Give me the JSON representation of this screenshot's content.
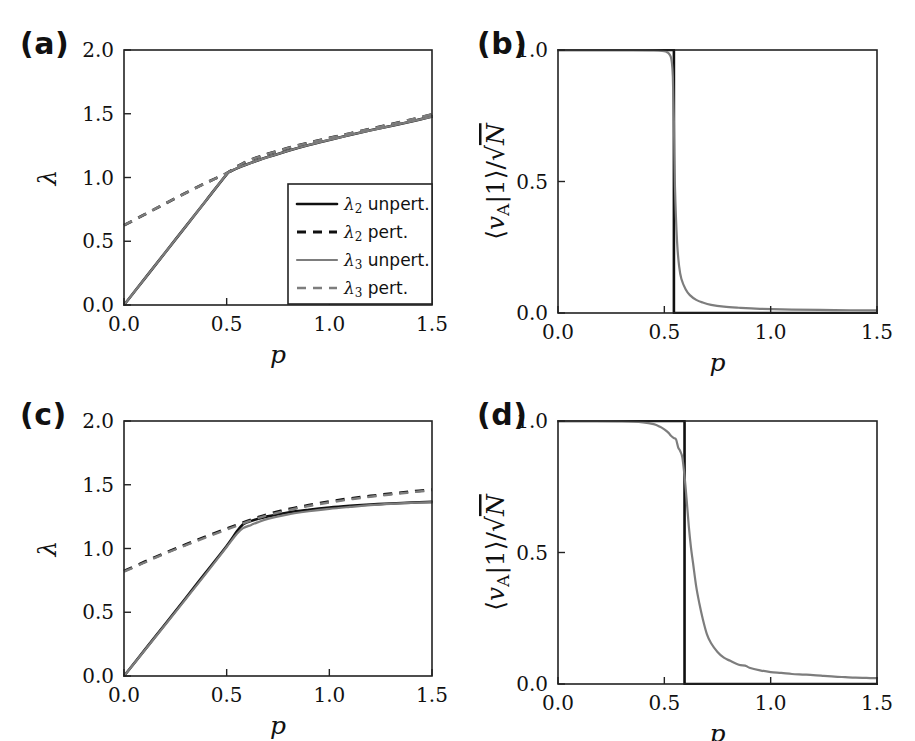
{
  "figure": {
    "width": 915,
    "height": 741,
    "background": "#ffffff",
    "panel_labels": [
      "(a)",
      "(b)",
      "(c)",
      "(d)"
    ]
  },
  "colors": {
    "black": "#101010",
    "gray": "#7d7d7d",
    "axis": "#222222",
    "background": "#ffffff"
  },
  "panels": {
    "a": {
      "label": "(a)",
      "xlabel": "p",
      "ylabel": "λ",
      "xticks": [
        "0.0",
        "0.5",
        "1.0",
        "1.5"
      ],
      "yticks": [
        "0.0",
        "0.5",
        "1.0",
        "1.5",
        "2.0"
      ],
      "legend": [
        {
          "label_lambda": "λ",
          "label_sub": "2",
          "label_rest": " unpert.",
          "style": "black-solid"
        },
        {
          "label_lambda": "λ",
          "label_sub": "2",
          "label_rest": " pert.",
          "style": "black-dashed"
        },
        {
          "label_lambda": "λ",
          "label_sub": "3",
          "label_rest": " unpert.",
          "style": "gray-solid"
        },
        {
          "label_lambda": "λ",
          "label_sub": "3",
          "label_rest": " pert.",
          "style": "gray-dashed"
        }
      ]
    },
    "b": {
      "label": "(b)",
      "xlabel": "p",
      "ylabel_parts": [
        "⟨",
        "v",
        "A",
        "|1",
        "⟩",
        "/",
        "√",
        "N"
      ],
      "xticks": [
        "0.0",
        "0.5",
        "1.0",
        "1.5"
      ],
      "yticks": [
        "0.0",
        "0.5",
        "1.0"
      ]
    },
    "c": {
      "label": "(c)",
      "xlabel": "p",
      "ylabel": "λ",
      "xticks": [
        "0.0",
        "0.5",
        "1.0",
        "1.5"
      ],
      "yticks": [
        "0.0",
        "0.5",
        "1.0",
        "1.5",
        "2.0"
      ]
    },
    "d": {
      "label": "(d)",
      "xlabel": "p",
      "ylabel_parts": [
        "⟨",
        "v",
        "A",
        "|1",
        "⟩",
        "/",
        "√",
        "N"
      ],
      "xticks": [
        "0.0",
        "0.5",
        "1.0",
        "1.5"
      ],
      "yticks": [
        "0.0",
        "0.5",
        "1.0"
      ]
    }
  },
  "chart_data": [
    {
      "id": "panel-a",
      "type": "line",
      "title": "(a)",
      "xlabel": "p",
      "ylabel": "λ",
      "xlim": [
        0.0,
        1.5
      ],
      "ylim": [
        0.0,
        2.0
      ],
      "xticks": [
        0.0,
        0.5,
        1.0,
        1.5
      ],
      "yticks": [
        0.0,
        0.5,
        1.0,
        1.5,
        2.0
      ],
      "grid": false,
      "legend_position": "lower right",
      "series": [
        {
          "name": "λ2 unpert.",
          "style": "solid",
          "color": "#101010",
          "x": [
            0.0,
            0.1,
            0.2,
            0.3,
            0.4,
            0.5,
            0.52,
            0.55,
            0.6,
            0.65,
            0.7,
            0.8,
            0.9,
            1.0,
            1.1,
            1.2,
            1.3,
            1.4,
            1.5
          ],
          "y": [
            0.0,
            0.205,
            0.41,
            0.615,
            0.82,
            1.025,
            1.048,
            1.072,
            1.104,
            1.133,
            1.16,
            1.21,
            1.255,
            1.295,
            1.333,
            1.37,
            1.404,
            1.44,
            1.478
          ]
        },
        {
          "name": "λ2 pert.",
          "style": "dashed",
          "color": "#101010",
          "x": [
            0.0,
            0.1,
            0.2,
            0.3,
            0.4,
            0.5,
            0.55,
            0.6,
            0.65,
            0.7,
            0.8,
            0.9,
            1.0,
            1.1,
            1.2,
            1.3,
            1.4,
            1.5
          ],
          "y": [
            0.625,
            0.71,
            0.795,
            0.878,
            0.958,
            1.034,
            1.085,
            1.128,
            1.158,
            1.185,
            1.232,
            1.272,
            1.31,
            1.345,
            1.382,
            1.418,
            1.455,
            1.495
          ]
        },
        {
          "name": "λ3 unpert.",
          "style": "solid",
          "color": "#7d7d7d",
          "x": [
            0.0,
            0.1,
            0.2,
            0.3,
            0.4,
            0.5,
            0.52,
            0.55,
            0.6,
            0.65,
            0.7,
            0.8,
            0.9,
            1.0,
            1.1,
            1.2,
            1.3,
            1.4,
            1.5
          ],
          "y": [
            0.0,
            0.205,
            0.41,
            0.615,
            0.82,
            1.025,
            1.048,
            1.072,
            1.104,
            1.133,
            1.16,
            1.21,
            1.255,
            1.295,
            1.333,
            1.37,
            1.404,
            1.44,
            1.478
          ]
        },
        {
          "name": "λ3 pert.",
          "style": "dashed",
          "color": "#7d7d7d",
          "x": [
            0.0,
            0.1,
            0.2,
            0.3,
            0.4,
            0.5,
            0.55,
            0.6,
            0.65,
            0.7,
            0.8,
            0.9,
            1.0,
            1.1,
            1.2,
            1.3,
            1.4,
            1.5
          ],
          "y": [
            0.625,
            0.71,
            0.795,
            0.878,
            0.958,
            1.034,
            1.085,
            1.128,
            1.158,
            1.185,
            1.232,
            1.272,
            1.31,
            1.345,
            1.382,
            1.418,
            1.455,
            1.495
          ]
        }
      ]
    },
    {
      "id": "panel-b",
      "type": "line",
      "title": "(b)",
      "xlabel": "p",
      "ylabel": "⟨v_A|1⟩/√N",
      "xlim": [
        0.0,
        1.5
      ],
      "ylim": [
        0.0,
        1.0
      ],
      "xticks": [
        0.0,
        0.5,
        1.0,
        1.5
      ],
      "yticks": [
        0.0,
        0.5,
        1.0
      ],
      "grid": false,
      "legend_position": "none",
      "series": [
        {
          "name": "unperturbed step",
          "style": "solid",
          "color": "#101010",
          "x": [
            0.0,
            0.3,
            0.54,
            0.545,
            0.545,
            0.6,
            0.9,
            1.2,
            1.5
          ],
          "y": [
            1.0,
            1.0,
            1.0,
            1.0,
            0.0,
            0.0,
            0.0,
            0.0,
            0.0
          ]
        },
        {
          "name": "perturbed",
          "style": "solid",
          "color": "#7d7d7d",
          "x": [
            0.0,
            0.2,
            0.35,
            0.45,
            0.49,
            0.51,
            0.52,
            0.53,
            0.535,
            0.54,
            0.545,
            0.55,
            0.56,
            0.57,
            0.58,
            0.6,
            0.62,
            0.65,
            0.68,
            0.72,
            0.78,
            0.85,
            0.95,
            1.1,
            1.3,
            1.5
          ],
          "y": [
            1.0,
            1.0,
            1.0,
            0.999,
            0.997,
            0.993,
            0.988,
            0.975,
            0.955,
            0.9,
            0.73,
            0.48,
            0.27,
            0.175,
            0.13,
            0.09,
            0.068,
            0.05,
            0.04,
            0.031,
            0.024,
            0.02,
            0.016,
            0.013,
            0.011,
            0.01
          ]
        }
      ]
    },
    {
      "id": "panel-c",
      "type": "line",
      "title": "(c)",
      "xlabel": "p",
      "ylabel": "λ",
      "xlim": [
        0.0,
        1.5
      ],
      "ylim": [
        0.0,
        2.0
      ],
      "xticks": [
        0.0,
        0.5,
        1.0,
        1.5
      ],
      "yticks": [
        0.0,
        0.5,
        1.0,
        1.5,
        2.0
      ],
      "grid": false,
      "legend_position": "none",
      "series": [
        {
          "name": "λ2 unpert.",
          "style": "solid",
          "color": "#101010",
          "x": [
            0.0,
            0.1,
            0.2,
            0.3,
            0.4,
            0.5,
            0.55,
            0.58,
            0.6,
            0.65,
            0.7,
            0.8,
            0.9,
            1.0,
            1.1,
            1.2,
            1.3,
            1.4,
            1.5
          ],
          "y": [
            0.0,
            0.203,
            0.406,
            0.61,
            0.815,
            1.02,
            1.135,
            1.19,
            1.205,
            1.232,
            1.252,
            1.283,
            1.304,
            1.321,
            1.334,
            1.345,
            1.353,
            1.36,
            1.366
          ]
        },
        {
          "name": "λ2 pert.",
          "style": "dashed",
          "color": "#101010",
          "x": [
            0.0,
            0.1,
            0.2,
            0.3,
            0.4,
            0.5,
            0.55,
            0.6,
            0.65,
            0.7,
            0.8,
            0.9,
            1.0,
            1.1,
            1.2,
            1.3,
            1.4,
            1.5
          ],
          "y": [
            0.823,
            0.895,
            0.965,
            1.03,
            1.095,
            1.155,
            1.185,
            1.215,
            1.243,
            1.268,
            1.308,
            1.34,
            1.368,
            1.392,
            1.412,
            1.43,
            1.447,
            1.462
          ]
        },
        {
          "name": "λ3 unpert.",
          "style": "solid",
          "color": "#7d7d7d",
          "x": [
            0.0,
            0.1,
            0.2,
            0.3,
            0.4,
            0.5,
            0.55,
            0.58,
            0.62,
            0.65,
            0.7,
            0.8,
            0.9,
            1.0,
            1.1,
            1.2,
            1.3,
            1.4,
            1.5
          ],
          "y": [
            0.0,
            0.2,
            0.4,
            0.602,
            0.805,
            1.012,
            1.115,
            1.16,
            1.185,
            1.205,
            1.232,
            1.268,
            1.292,
            1.311,
            1.326,
            1.34,
            1.35,
            1.358,
            1.363
          ]
        },
        {
          "name": "λ3 pert.",
          "style": "dashed",
          "color": "#7d7d7d",
          "x": [
            0.0,
            0.1,
            0.2,
            0.3,
            0.4,
            0.5,
            0.55,
            0.6,
            0.65,
            0.7,
            0.8,
            0.9,
            1.0,
            1.1,
            1.2,
            1.3,
            1.4,
            1.5
          ],
          "y": [
            0.818,
            0.89,
            0.96,
            1.025,
            1.088,
            1.148,
            1.178,
            1.208,
            1.236,
            1.261,
            1.301,
            1.333,
            1.361,
            1.385,
            1.406,
            1.424,
            1.441,
            1.456
          ]
        }
      ]
    },
    {
      "id": "panel-d",
      "type": "line",
      "title": "(d)",
      "xlabel": "p",
      "ylabel": "⟨v_A|1⟩/√N",
      "xlim": [
        0.0,
        1.5
      ],
      "ylim": [
        0.0,
        1.0
      ],
      "xticks": [
        0.0,
        0.5,
        1.0,
        1.5
      ],
      "yticks": [
        0.0,
        0.5,
        1.0
      ],
      "grid": false,
      "legend_position": "none",
      "series": [
        {
          "name": "unperturbed step",
          "style": "solid",
          "color": "#101010",
          "x": [
            0.0,
            0.3,
            0.59,
            0.595,
            0.595,
            0.65,
            0.9,
            1.2,
            1.5
          ],
          "y": [
            1.0,
            1.0,
            1.0,
            1.0,
            0.0,
            0.0,
            0.0,
            0.0,
            0.0
          ]
        },
        {
          "name": "perturbed",
          "style": "solid",
          "color": "#7d7d7d",
          "x": [
            0.0,
            0.15,
            0.3,
            0.4,
            0.45,
            0.48,
            0.5,
            0.52,
            0.53,
            0.545,
            0.555,
            0.565,
            0.575,
            0.585,
            0.595,
            0.605,
            0.615,
            0.625,
            0.635,
            0.65,
            0.665,
            0.68,
            0.7,
            0.72,
            0.75,
            0.78,
            0.81,
            0.85,
            0.88,
            0.9,
            0.95,
            1.0,
            1.05,
            1.1,
            1.15,
            1.2,
            1.25,
            1.3,
            1.35,
            1.4,
            1.45,
            1.5
          ],
          "y": [
            1.0,
            1.0,
            0.999,
            0.995,
            0.988,
            0.978,
            0.968,
            0.955,
            0.945,
            0.935,
            0.93,
            0.9,
            0.885,
            0.86,
            0.79,
            0.7,
            0.6,
            0.52,
            0.46,
            0.37,
            0.305,
            0.25,
            0.19,
            0.155,
            0.122,
            0.1,
            0.088,
            0.073,
            0.07,
            0.062,
            0.052,
            0.045,
            0.042,
            0.038,
            0.036,
            0.034,
            0.031,
            0.028,
            0.026,
            0.024,
            0.023,
            0.022
          ]
        }
      ]
    }
  ]
}
